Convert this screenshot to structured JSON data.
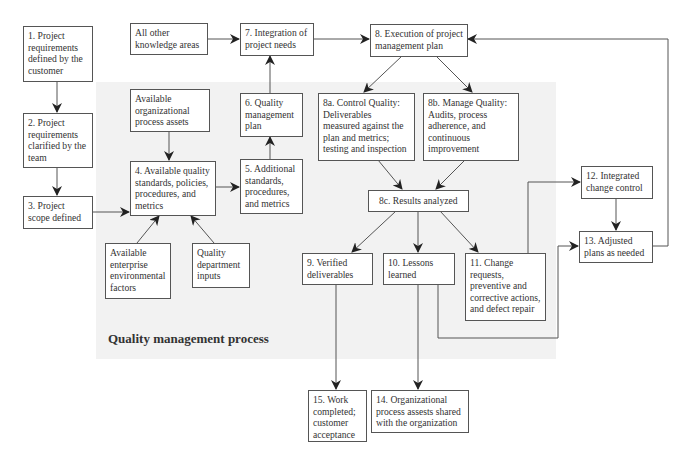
{
  "region": {
    "label": "Quality management process",
    "color": "#f2f2f2"
  },
  "nodes": {
    "n1": "1. Project requirements defined by the customer",
    "n2": "2. Project requirements clarified by the team",
    "n3": "3. Project scope defined",
    "other": "All other knowledge areas",
    "opa": "Available organizational process assets",
    "n4": "4. Available quality standards, policies, procedures, and metrics",
    "eef": "Available enterprise environmental factors",
    "qdi": "Quality department inputs",
    "n5": "5. Additional standards, procedures, and metrics",
    "n6": "6. Quality management plan",
    "n7": "7. Integration of project needs",
    "n8": "8. Execution of project management plan",
    "n8a": "8a. Control Quality: Deliverables measured against the plan and metrics; testing and inspection",
    "n8b": "8b. Manage Quality: Audits, process adherence, and continuous improvement",
    "n8c": "8c. Results analyzed",
    "n9": "9. Verified deliverables",
    "n10": "10. Lessons learned",
    "n11": "11. Change requests, preventive and corrective actions, and defect repair",
    "n12": "12. Integrated change control",
    "n13": "13. Adjusted plans as needed",
    "n14": "14. Organizational process assests shared with the organization",
    "n15": "15. Work completed; customer acceptance"
  }
}
